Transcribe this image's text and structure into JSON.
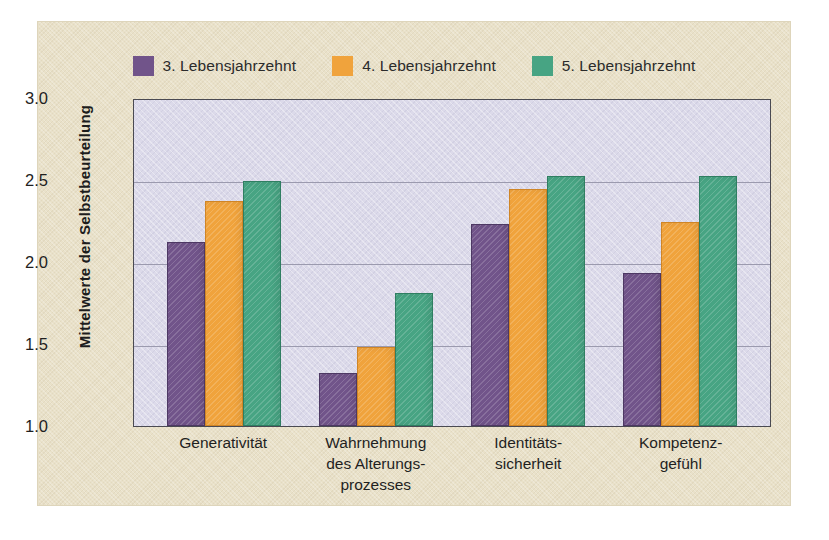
{
  "chart_data": {
    "type": "bar",
    "title": "",
    "xlabel": "",
    "ylabel": "Mittelwerte der Selbstbeurteilung",
    "ylim": [
      1.0,
      3.0
    ],
    "yticks": [
      "3.0",
      "2.5",
      "2.0",
      "1.5",
      "1.0"
    ],
    "ytick_values": [
      3.0,
      2.5,
      2.0,
      1.5,
      1.0
    ],
    "grid": true,
    "legend_position": "top-center",
    "categories": [
      "Generativität",
      "Wahrnehmung\ndes Alterungs-\nprozesses",
      "Identitäts-\nsicherheit",
      "Kompetenz-\ngefühl"
    ],
    "category_lines": [
      [
        "Generativität"
      ],
      [
        "Wahrnehmung",
        "des Alterungs-",
        "prozesses"
      ],
      [
        "Identitäts-",
        "sicherheit"
      ],
      [
        "Kompetenz-",
        "gefühl"
      ]
    ],
    "series": [
      {
        "name": "3. Lebensjahrzehnt",
        "color": "#71548a",
        "values": [
          2.11,
          1.31,
          2.22,
          1.92
        ]
      },
      {
        "name": "4. Lebensjahrzehnt",
        "color": "#f0a33c",
        "values": [
          2.36,
          1.47,
          2.43,
          2.23
        ]
      },
      {
        "name": "5. Lebensjahrzehnt",
        "color": "#47a483",
        "values": [
          2.48,
          1.8,
          2.51,
          2.51
        ]
      }
    ]
  },
  "colors": {
    "figure_background": "#e9e1c9",
    "plot_background": "#dcdaea",
    "plot_border": "#4a4a52",
    "gridline": "#9b9aae",
    "text": "#1f1f1f"
  }
}
